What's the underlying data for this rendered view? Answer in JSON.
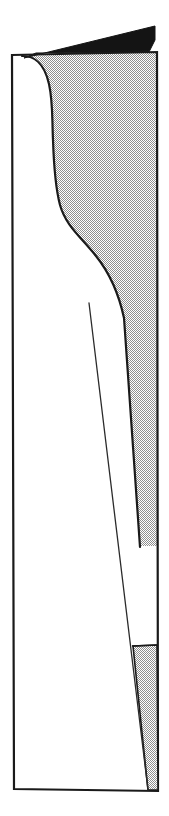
{
  "figure": {
    "kind": "technical-line-drawing",
    "canvas": {
      "width": 169,
      "height": 816
    },
    "background_color": "#ffffff"
  },
  "colors": {
    "background": "#ffffff",
    "outline": "#1a1a1a",
    "solid_fill": "#141414",
    "halftone_fill": "#c9c9c9",
    "halftone_dot": "#8f8f8f",
    "thin_line": "#2b2b2b"
  },
  "shapes": {
    "panel_outline": {
      "name": "panel-outline",
      "description": "Tall narrow quadrilateral frame, slightly tapered",
      "points": "12,55 157,52 158,791 14,789",
      "stroke_width": 2.2,
      "fill": "none"
    },
    "black_wedge": {
      "name": "black-wedge",
      "description": "Solid dark triangular flap above the panel top edge",
      "points": "24,58 155,26 155,40 148,52 36,52",
      "fill_ref": "colors.solid_fill"
    },
    "shaded_region": {
      "name": "shaded-region",
      "description": "Halftone shaded area bounded left by the S-curve and right by the panel right edge, tapering to a point",
      "path": "M 22,56 C 34,56 44,62 49,84 C 53,102 52,118 53,140 C 54,170 56,190 60,205 C 66,226 80,236 96,256 C 108,271 118,290 124,318 L 140,546 L 157,546 L 157,52 Z",
      "fill_ref": "colors.halftone_fill",
      "stroke_width": 2.2
    },
    "scurve": {
      "name": "profile-s-curve",
      "description": "Main bounding S-shaped profile curve from top-left of panel down to the taper point",
      "path": "M 22,56 C 34,56 44,62 49,84 C 53,102 52,118 53,140 C 54,170 56,190 60,205 C 66,226 80,236 96,256 C 108,271 118,290 124,318 L 140,547",
      "stroke_width": 2.2,
      "fill": "none"
    },
    "lower_wedge": {
      "name": "lower-shaded-wedge",
      "description": "Small halftone triangular wedge near the bottom-right of the panel",
      "points": "133,646 157,645 158,790 148,790",
      "fill_ref": "colors.halftone_fill",
      "stroke_width": 1.6
    },
    "lower_wedge_top_rule": {
      "name": "lower-wedge-top-rule",
      "description": "Short horizontal tick closing the top of the lower wedge",
      "x1": 132,
      "y1": 646,
      "x2": 157,
      "y2": 645,
      "stroke_width": 1.6
    },
    "thin_diagonal": {
      "name": "thin-diagonal-line",
      "description": "Single hairline running from mid-panel down to the bottom edge",
      "x1": 89,
      "y1": 303,
      "x2": 148,
      "y2": 790,
      "stroke_width": 1.3
    }
  }
}
